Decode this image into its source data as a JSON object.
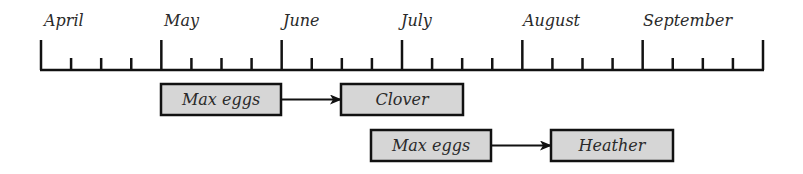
{
  "timeline": {
    "months": [
      "April",
      "May",
      "June",
      "July",
      "August",
      "September"
    ],
    "axis": {
      "x_start": 41,
      "x_end": 763,
      "baseline_y": 70,
      "major_top_y": 40,
      "minor_top_y": 58,
      "month_width": 120.3,
      "minor_per_month": 3
    }
  },
  "rows": [
    {
      "from": {
        "label": "Max eggs",
        "x": 161,
        "y": 84,
        "w": 120,
        "h": 31
      },
      "to": {
        "label": "Clover",
        "x": 341,
        "y": 84,
        "w": 122,
        "h": 31
      }
    },
    {
      "from": {
        "label": "Max eggs",
        "x": 371,
        "y": 130,
        "w": 120,
        "h": 31
      },
      "to": {
        "label": "Heather",
        "x": 551,
        "y": 130,
        "w": 122,
        "h": 31
      }
    }
  ],
  "colors": {
    "line": "#111111",
    "box_fill": "#d6d6d6",
    "box_border": "#111111",
    "text": "#2a2a2a"
  }
}
